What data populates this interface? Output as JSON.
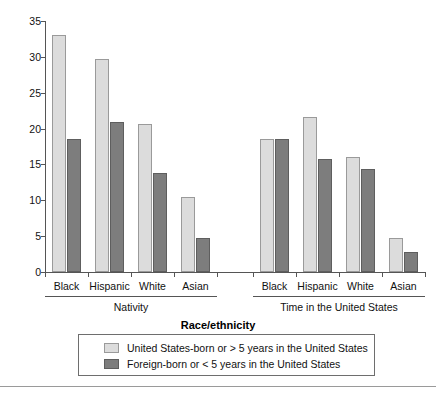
{
  "chart_data": {
    "type": "bar",
    "title": "",
    "xlabel": "Race/ethnicity",
    "ylabel": "",
    "ylim": [
      0,
      35
    ],
    "ytick_labels": [
      "0",
      "5",
      "10",
      "15",
      "20",
      "25",
      "30",
      "35"
    ],
    "ytick_values": [
      0,
      5,
      10,
      15,
      20,
      25,
      30,
      35
    ],
    "grid": false,
    "legend_position": "bottom",
    "categories": [
      "Black",
      "Hispanic",
      "White",
      "Asian"
    ],
    "panels": [
      {
        "label": "Nativity",
        "categories": [
          "Black",
          "Hispanic",
          "White",
          "Asian"
        ],
        "series": [
          {
            "name": "United States-born or > 5 years in the United States",
            "color": "#dcdcdc",
            "values": [
              33.1,
              29.7,
              20.7,
              10.5
            ]
          },
          {
            "name": "Foreign-born or < 5 years in the United States",
            "color": "#7d7d7d",
            "values": [
              18.5,
              20.9,
              13.8,
              4.8
            ]
          }
        ]
      },
      {
        "label": "Time in the United States",
        "categories": [
          "Black",
          "Hispanic",
          "White",
          "Asian"
        ],
        "series": [
          {
            "name": "United States-born or > 5 years in the United States",
            "color": "#dcdcdc",
            "values": [
              18.6,
              21.6,
              16.0,
              4.8
            ]
          },
          {
            "name": "Foreign-born or < 5 years in the United States",
            "color": "#7d7d7d",
            "values": [
              18.5,
              15.7,
              14.4,
              2.8
            ]
          }
        ]
      }
    ],
    "legend": [
      {
        "label": "United States-born or > 5 years in the United States",
        "color": "#dcdcdc",
        "swatch": "light-swatch"
      },
      {
        "label": "Foreign-born or < 5 years in the United States",
        "color": "#7d7d7d",
        "swatch": "dark-swatch"
      }
    ]
  },
  "axis": {
    "x_title": "Race/ethnicity"
  },
  "colors": {
    "light_bar": "#dcdcdc",
    "dark_bar": "#7d7d7d",
    "axis": "#555555",
    "background": "#ffffff"
  }
}
